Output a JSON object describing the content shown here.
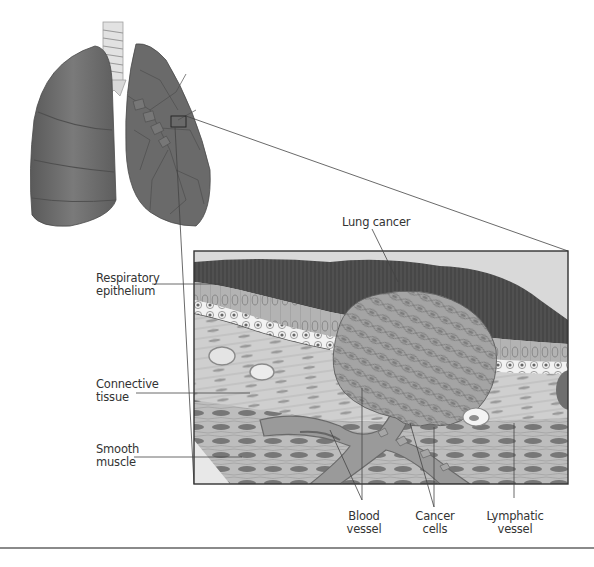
{
  "figure": {
    "labels": {
      "lung_cancer": [
        "Lung cancer"
      ],
      "respiratory_epithelium": [
        "Respiratory",
        "epithelium"
      ],
      "connective_tissue": [
        "Connective",
        "tissue"
      ],
      "smooth_muscle": [
        "Smooth",
        "muscle"
      ],
      "blood_vessel": [
        "Blood",
        "vessel"
      ],
      "cancer_cells": [
        "Cancer",
        "cells"
      ],
      "lymphatic_vessel": [
        "Lymphatic",
        "vessel"
      ]
    },
    "colors": {
      "lung": "#6e6e6e",
      "lung_dark": "#575757",
      "mucus": "#4a4a4a",
      "epithelium": "#a9a9a9",
      "connective": "#c8c8c8",
      "muscle": "#b4b4b4",
      "tumor": "#9c9c9c",
      "vessel": "#8f8f8f",
      "frame": "#333333"
    }
  }
}
